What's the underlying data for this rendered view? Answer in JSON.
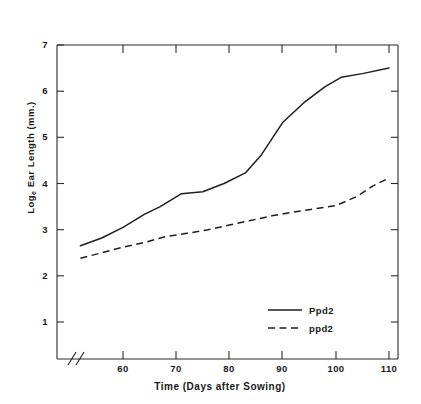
{
  "figure": {
    "top_caption_remnant": "",
    "background_color": "#ffffff",
    "ink_color": "#1f1f1f"
  },
  "axes": {
    "y_label_prefix": "Log",
    "y_label_sub": "e",
    "y_label_suffix": " Ear Length (mm.)",
    "x_label": "Time (Days after Sowing)",
    "y_ticks": [
      "1",
      "2",
      "3",
      "4",
      "5",
      "6",
      "7"
    ],
    "x_ticks": [
      "60",
      "70",
      "80",
      "90",
      "100",
      "110"
    ],
    "axis_break_symbol": "//"
  },
  "legend": {
    "position": "bottom-right",
    "entries": [
      {
        "label": "Ppd2",
        "style": "solid"
      },
      {
        "label": "ppd2",
        "style": "dashed"
      }
    ]
  },
  "chart_data": {
    "type": "line",
    "title": "",
    "xlabel": "Time (Days after Sowing)",
    "ylabel": "Log_e Ear Length (mm.)",
    "xlim": [
      52,
      112
    ],
    "ylim": [
      0.5,
      7.4
    ],
    "grid": false,
    "legend_position": "lower right",
    "axis_break_x": true,
    "series": [
      {
        "name": "Ppd2",
        "style": "solid",
        "x": [
          52,
          56,
          60,
          64,
          67,
          71,
          75,
          79,
          83,
          86,
          90,
          94,
          98,
          101,
          105,
          110
        ],
        "y": [
          2.65,
          2.82,
          3.05,
          3.33,
          3.5,
          3.78,
          3.82,
          4.0,
          4.23,
          4.62,
          5.32,
          5.75,
          6.1,
          6.3,
          6.38,
          6.5
        ]
      },
      {
        "name": "ppd2",
        "style": "dashed",
        "x": [
          52,
          56,
          60,
          64,
          68,
          72,
          76,
          80,
          84,
          88,
          92,
          96,
          100,
          104,
          107,
          110
        ],
        "y": [
          2.38,
          2.5,
          2.62,
          2.72,
          2.85,
          2.92,
          3.0,
          3.1,
          3.2,
          3.3,
          3.38,
          3.45,
          3.52,
          3.72,
          3.95,
          4.12
        ]
      }
    ]
  }
}
